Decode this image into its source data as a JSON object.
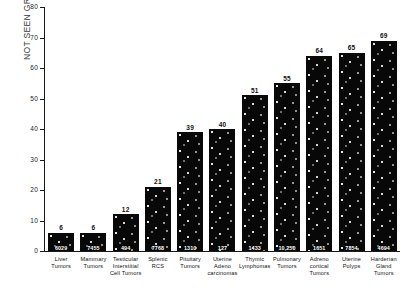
{
  "chart_data": {
    "type": "bar",
    "title": "",
    "ylabel_lines": [
      "NOT SEEN GROSSLY",
      "Percent"
    ],
    "xlabel": "",
    "ylim": [
      0,
      80
    ],
    "yticks": [
      0,
      10,
      20,
      30,
      40,
      50,
      60,
      70,
      80
    ],
    "ytick_labels": [
      "0",
      "10",
      "20",
      "30",
      "40",
      "50",
      "60",
      "70",
      "80"
    ],
    "grid": false,
    "legend": "none",
    "bar_color": "#080808",
    "categories": [
      "Liver Tumors",
      "Mammary Tumors",
      "Testicular Interstitial Cell Tumors",
      "Splenic RCS",
      "Pituitary Tumors",
      "Uterine Adeno carcinomas",
      "Thymic Lymphomas",
      "Pulmonary Tumors",
      "Adreno cortical Tumors",
      "Uterine Polyps",
      "Harderian Gland Tumors"
    ],
    "category_lines": [
      [
        "Liver",
        "Tumors"
      ],
      [
        "Mammary",
        "Tumors"
      ],
      [
        "Testicular",
        "Interstitial",
        "Cell Tumors"
      ],
      [
        "Splenic",
        "RCS"
      ],
      [
        "Pituitary",
        "Tumors"
      ],
      [
        "Uterine",
        "Adeno",
        "carcinomas"
      ],
      [
        "Thymic",
        "Lymphomas"
      ],
      [
        "Pulmonary",
        "Tumors"
      ],
      [
        "Adreno",
        "cortical",
        "Tumors"
      ],
      [
        "Uterine",
        "Polyps"
      ],
      [
        "Harderian",
        "Gland",
        "Tumors"
      ]
    ],
    "values": [
      6,
      6,
      12,
      21,
      39,
      40,
      51,
      55,
      64,
      65,
      69
    ],
    "value_labels": [
      "6",
      "6",
      "12",
      "21",
      "39",
      "40",
      "51",
      "55",
      "64",
      "65",
      "69"
    ],
    "denominators": [
      "6029",
      "7455",
      "494",
      "7768",
      "1310",
      "127",
      "1433",
      "10,250",
      "1651",
      "7854",
      "4694"
    ]
  }
}
